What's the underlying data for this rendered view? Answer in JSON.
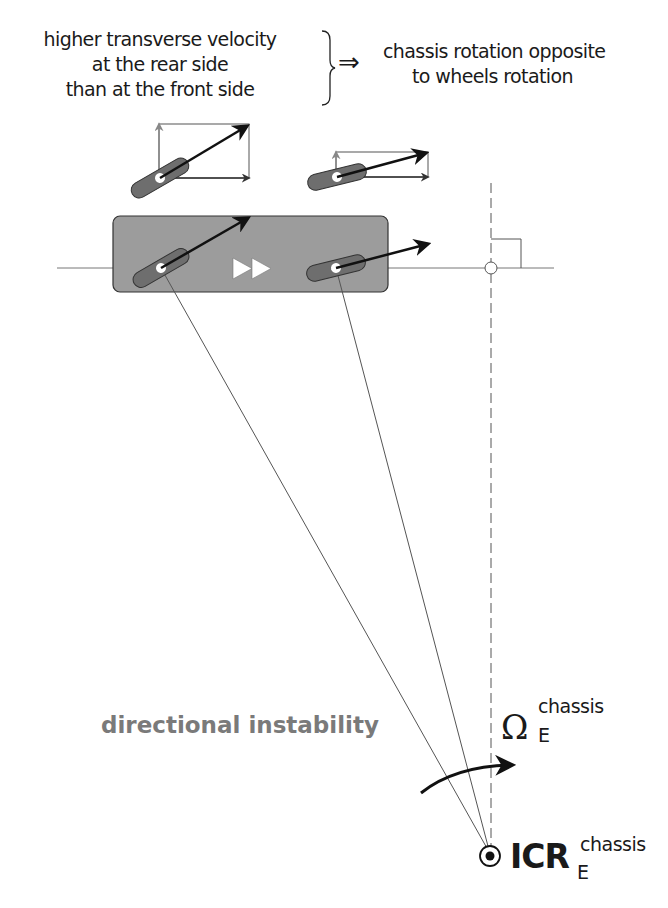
{
  "condition": {
    "lines": [
      "higher transverse velocity",
      "at the rear side",
      "than at the front side"
    ]
  },
  "implies_symbol": "⇒",
  "result": {
    "lines": [
      "chassis rotation opposite",
      "to wheels rotation"
    ]
  },
  "label_instability": "directional instability",
  "omega_label": {
    "symbol": "Ω",
    "subscript": "E",
    "superscript": "chassis"
  },
  "icr_label": {
    "symbol": "ICR",
    "subscript": "E",
    "superscript": "chassis"
  },
  "colors": {
    "chassis_fill": "#9c9c9c",
    "wheel_fill": "#6e6e6e",
    "arrow": "#111111",
    "component_arrow": "#888888",
    "instability_text": "#7a7a7a",
    "thin_line": "#555555"
  },
  "diagram": {
    "chassis": {
      "x": 113,
      "y": 216,
      "w": 275,
      "h": 76,
      "rx": 7
    },
    "axis_y": 268,
    "rear_wheel": {
      "cx": 161,
      "cy": 268,
      "angle": -30
    },
    "front_wheel": {
      "cx": 336,
      "cy": 268,
      "angle": -14
    },
    "icr_point": {
      "x": 490,
      "y": 856
    },
    "dashed_line_x": 491
  }
}
